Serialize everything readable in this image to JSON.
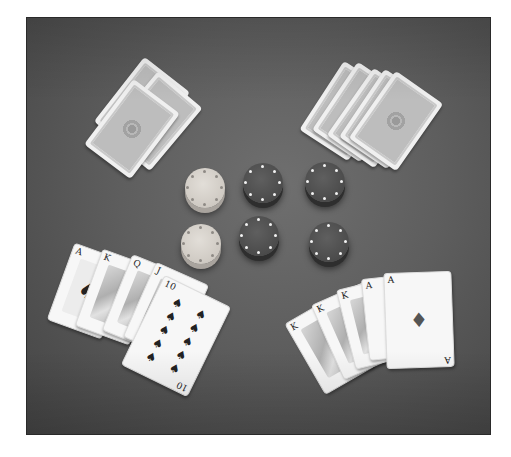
{
  "image": {
    "description": "Grayscale photograph of a poker table viewed from above",
    "background_color": "#5e5e5e",
    "frame_border_color": "#2a2a2a"
  },
  "scene": {
    "top_left_hand": {
      "type": "face-down cards",
      "count": 3
    },
    "top_right_hand": {
      "type": "face-down cards",
      "count": 5
    },
    "chips": {
      "light_stacks": 2,
      "dark_stacks": 4,
      "layout": "2 rows x 3 columns"
    },
    "bottom_left_hand": {
      "type": "royal flush",
      "suit": "spades",
      "cards": [
        {
          "rank": "A",
          "suit": "♠"
        },
        {
          "rank": "K",
          "suit": "♠"
        },
        {
          "rank": "Q",
          "suit": "♠"
        },
        {
          "rank": "J",
          "suit": "♠"
        },
        {
          "rank": "10",
          "suit": "♠"
        }
      ]
    },
    "bottom_right_hand": {
      "type": "full house",
      "cards": [
        {
          "rank": "K",
          "suit": "♣"
        },
        {
          "rank": "K",
          "suit": "♥"
        },
        {
          "rank": "K",
          "suit": "♠"
        },
        {
          "rank": "A",
          "suit": "♣"
        },
        {
          "rank": "A",
          "suit": "♦"
        }
      ]
    }
  }
}
